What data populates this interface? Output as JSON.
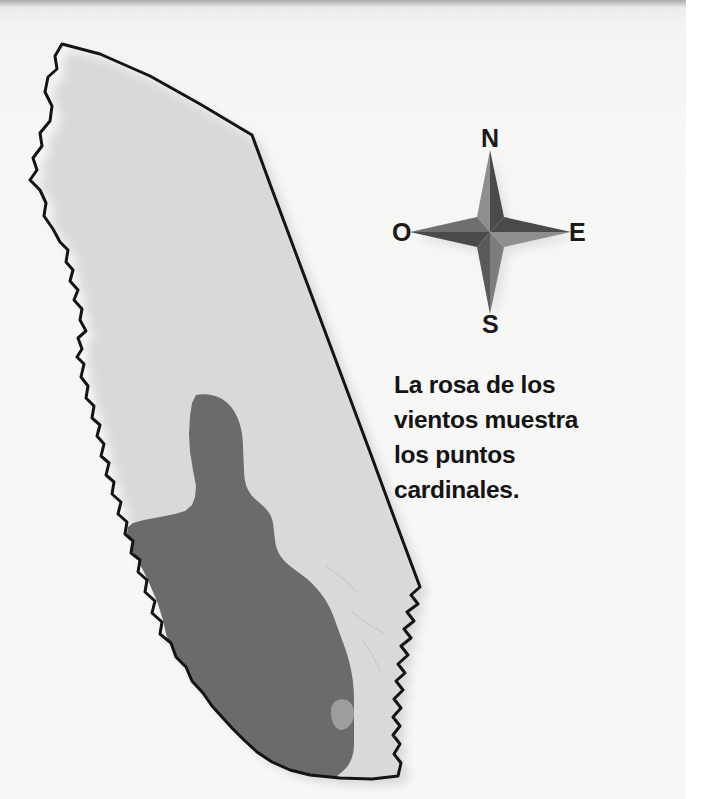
{
  "page": {
    "type": "scanned-textbook-page",
    "background_color": "#f7f7f6",
    "top_edge_color": "#adadaf"
  },
  "map": {
    "name": "california-map",
    "subject": "California",
    "land_fill": "#b3b3b3",
    "highlight_fill": "#6b6b6b",
    "outline_color": "#141414",
    "shadow_color": "#cfcfcf",
    "regions": [
      {
        "name": "california-state-outline",
        "label": "",
        "fill": "#b3b3b3"
      },
      {
        "name": "central-valley-highlight",
        "label": "",
        "fill": "#6b6b6b"
      }
    ]
  },
  "compass": {
    "name": "compass-rose",
    "center": {
      "x": 490,
      "y": 232
    },
    "light_face": "#8e8e8e",
    "dark_face": "#4a4a4a",
    "labels": {
      "north": "N",
      "south": "S",
      "east": "E",
      "west": "O"
    }
  },
  "caption": {
    "name": "compass-caption",
    "lines": [
      "La rosa de los",
      "vientos muestra",
      "los puntos",
      "cardinales."
    ],
    "text": "La rosa de los vientos muestra los puntos cardinales.",
    "color": "#141414"
  }
}
